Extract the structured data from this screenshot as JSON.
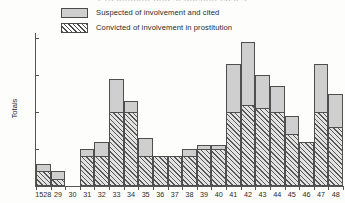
{
  "chart_data": {
    "type": "bar",
    "title": "Prostitution and seduction cases",
    "xlabel": "",
    "ylabel": "Totals",
    "ylim": [
      0,
      21
    ],
    "yticks": [
      5,
      10,
      15,
      20
    ],
    "grid": false,
    "legend_position": "top-left",
    "stacked_overlay": true,
    "categories": [
      "1528",
      "29",
      "30",
      "31",
      "32",
      "33",
      "34",
      "35",
      "36",
      "37",
      "38",
      "39",
      "40",
      "41",
      "42",
      "43",
      "44",
      "45",
      "46",
      "47",
      "48"
    ],
    "series": [
      {
        "name": "Suspected of involvement and cited",
        "style": "plain-grey",
        "values": [
          3,
          2,
          0,
          5,
          6,
          14.5,
          11.5,
          6.5,
          4,
          4,
          5,
          5.5,
          5.5,
          16.5,
          19.5,
          15,
          13.5,
          9.5,
          6,
          16.5,
          12.5
        ]
      },
      {
        "name": "Convicted of involvement in prostitution",
        "style": "hatched",
        "values": [
          2,
          1,
          0,
          4,
          4,
          10,
          10,
          4,
          4,
          4,
          4,
          5,
          5,
          10,
          11,
          10.5,
          10,
          7,
          6,
          10,
          8
        ]
      }
    ]
  },
  "legend": {
    "items": [
      {
        "label": "Suspected of involvement and cited",
        "swatch": "plain-grey"
      },
      {
        "label": "Convicted of involvement in prostitution",
        "swatch": "hatched"
      }
    ]
  }
}
